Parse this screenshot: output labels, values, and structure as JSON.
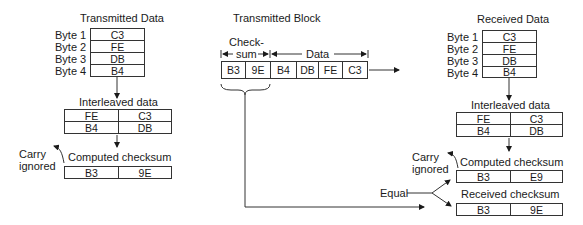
{
  "left": {
    "title": "Transmitted Data",
    "bytes": [
      {
        "label": "Byte 1",
        "value": "C3"
      },
      {
        "label": "Byte 2",
        "value": "FE"
      },
      {
        "label": "Byte 3",
        "value": "DB"
      },
      {
        "label": "Byte 4",
        "value": "B4"
      }
    ],
    "interleaved_title": "Interleaved data",
    "interleaved": [
      [
        "FE",
        "C3"
      ],
      [
        "B4",
        "DB"
      ]
    ],
    "carry_line1": "Carry",
    "carry_line2": "ignored",
    "computed_title": "Computed checksum",
    "computed": [
      "B3",
      "9E"
    ]
  },
  "middle": {
    "title": "Transmitted Block",
    "checksum_label_line1": "Check-",
    "checksum_label_line2": "sum",
    "data_label": "Data",
    "cells": [
      "B3",
      "9E",
      "B4",
      "DB",
      "FE",
      "C3"
    ]
  },
  "right": {
    "title": "Received Data",
    "bytes": [
      {
        "label": "Byte 1",
        "value": "C3"
      },
      {
        "label": "Byte 2",
        "value": "FE"
      },
      {
        "label": "Byte 3",
        "value": "DB"
      },
      {
        "label": "Byte 4",
        "value": "B4"
      }
    ],
    "interleaved_title": "Interleaved data",
    "interleaved": [
      [
        "FE",
        "C3"
      ],
      [
        "B4",
        "DB"
      ]
    ],
    "carry_line1": "Carry",
    "carry_line2": "ignored",
    "computed_title": "Computed checksum",
    "computed": [
      "B3",
      "E9"
    ],
    "received_title": "Received checksum",
    "received": [
      "B3",
      "9E"
    ],
    "equal_label": "Equal"
  }
}
